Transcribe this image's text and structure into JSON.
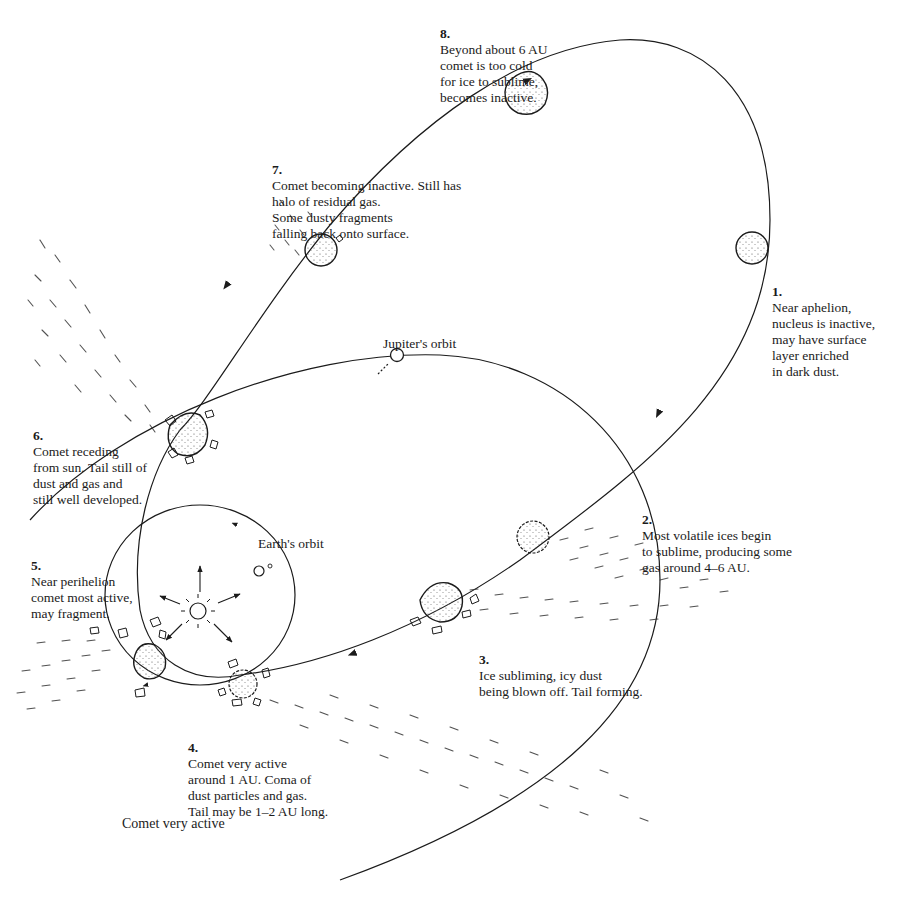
{
  "diagram": {
    "caption": "Comet very active",
    "orbits": {
      "jupiter": "Jupiter's orbit",
      "earth": "Earth's orbit"
    },
    "stages": [
      {
        "num": "1.",
        "text": "Near aphelion,\nnucleus is inactive,\nmay have surface\nlayer enriched\nin dark dust."
      },
      {
        "num": "2.",
        "text": "Most volatile ices begin\nto sublime, producing some\ngas around 4–6 AU."
      },
      {
        "num": "3.",
        "text": "Ice subliming, icy dust\nbeing blown off. Tail forming."
      },
      {
        "num": "4.",
        "text": "Comet very active\naround 1 AU. Coma of\ndust particles and gas.\nTail may be 1–2 AU long."
      },
      {
        "num": "5.",
        "text": "Near perihelion\ncomet most active,\nmay fragment."
      },
      {
        "num": "6.",
        "text": "Comet receding\nfrom sun. Tail still of\ndust and gas and\nstill well developed."
      },
      {
        "num": "7.",
        "text": "Comet becoming inactive. Still has\nhalo of residual gas.\nSome dusty fragments\nfalling back onto surface."
      },
      {
        "num": "8.",
        "text": "Beyond about 6 AU\ncomet is too cold\nfor ice to sublime,\nbecomes inactive."
      }
    ],
    "colors": {
      "ink": "#1b1b1b",
      "background": "#ffffff"
    }
  }
}
